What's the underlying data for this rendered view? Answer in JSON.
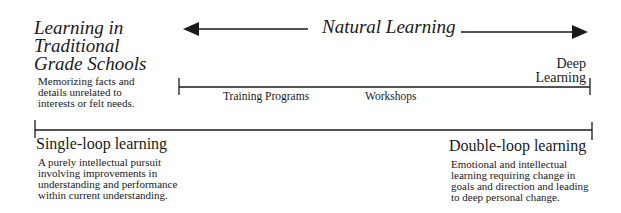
{
  "diagram": {
    "left_heading": {
      "lines": [
        "Learning in",
        "Traditional",
        "Grade Schools"
      ],
      "description_lines": [
        "Memorizing facts and",
        "details unrelated to",
        "interests or felt needs."
      ]
    },
    "top_arrow": {
      "label": "Natural Learning",
      "direction": "bidirectional"
    },
    "middle_scale": {
      "right_label_lines": [
        "Deep",
        "Learning"
      ],
      "points": [
        {
          "label": "Training Programs"
        },
        {
          "label": "Workshops"
        }
      ]
    },
    "bottom_scale": {
      "left": {
        "title": "Single-loop learning",
        "description_lines": [
          "A purely intellectual pursuit",
          "involving improvements in",
          "understanding and performance",
          "within current understanding."
        ]
      },
      "right": {
        "title": "Double-loop learning",
        "description_lines": [
          "Emotional and intellectual",
          "learning requiring change in",
          "goals and direction and leading",
          "to deep personal change."
        ]
      }
    },
    "colors": {
      "ink": "#1a1a1a",
      "background": "#ffffff"
    }
  }
}
